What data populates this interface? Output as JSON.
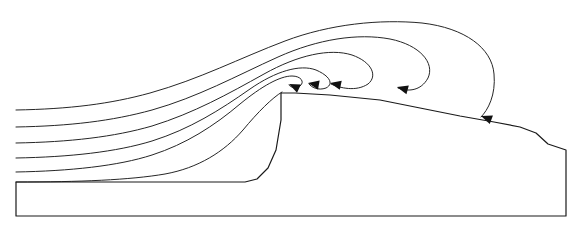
{
  "figure": {
    "type": "streamline-diagram",
    "width": 580,
    "height": 232,
    "background_color": "#ffffff",
    "line_color": "#262626",
    "terrain_color": "#1a1a1a",
    "arrow_color": "#111111",
    "stream_count": 6,
    "arrow_count": 6
  },
  "chart_data": {
    "type": "line",
    "xlabel": "",
    "ylabel": "",
    "xlim": [
      0,
      580
    ],
    "ylim": [
      232,
      0
    ],
    "grid": false,
    "legend": "none",
    "annotations": [],
    "terrain": {
      "name": "ground-boundary",
      "path": "M 16 182 L 16 216 L 566 216 L 566 150 L 548 144 L 536 133 L 520 127 L 494 122 L 460 116 L 420 108 L 380 100 L 330 95 L 295 93 L 281 93 L 281 120 L 276 150 L 268 168 L 257 179 L 245 182 Z"
    },
    "series": [
      {
        "name": "streamline-1-outermost",
        "inlet_y": 110,
        "arrow": {
          "x": 481,
          "y": 116,
          "angle": 200
        },
        "path": "M 16 110 C 70 109 110 104 150 93 C 200 79 240 58 285 41 C 330 24 380 19 422 23 C 465 28 492 48 494 74 C 496 95 488 110 481 117"
      },
      {
        "name": "streamline-2",
        "inlet_y": 127,
        "arrow": {
          "x": 397,
          "y": 87,
          "angle": 195
        },
        "path": "M 16 127 C 70 126 112 121 152 110 C 198 97 236 76 278 57 C 318 39 358 33 390 39 C 420 45 435 63 428 78 C 421 91 408 92 398 88"
      },
      {
        "name": "streamline-3",
        "inlet_y": 143,
        "arrow": {
          "x": 330,
          "y": 83,
          "angle": 192
        },
        "path": "M 16 143 C 70 142 114 137 152 126 C 194 113 228 94 264 74 C 298 55 330 48 352 55 C 372 62 378 76 368 84 C 356 92 340 88 331 84"
      },
      {
        "name": "streamline-4",
        "inlet_y": 158,
        "arrow": {
          "x": 308,
          "y": 83,
          "angle": 190
        },
        "path": "M 16 158 C 70 157 116 152 152 141 C 190 129 220 110 250 89 C 276 71 300 64 316 70 C 330 76 334 84 326 88 C 318 91 311 87 309 84"
      },
      {
        "name": "streamline-5",
        "inlet_y": 172,
        "arrow": {
          "x": 289,
          "y": 84,
          "angle": 205
        },
        "path": "M 16 172 C 70 171 118 166 152 155 C 186 144 214 126 240 104 C 262 86 280 76 292 76 C 301 76 305 82 300 86 C 295 89 290 87 289 85"
      },
      {
        "name": "streamline-6-innermost-spiral",
        "inlet_y": 182,
        "arrow": null,
        "path": "M 16 182 C 80 182 130 180 165 174 C 198 168 224 152 243 130 C 258 112 272 98 282 92"
      }
    ]
  }
}
